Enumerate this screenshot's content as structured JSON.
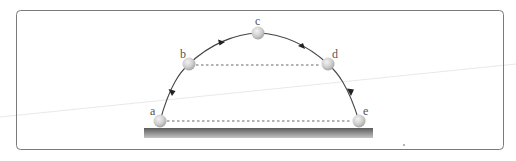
{
  "diagram": {
    "points": [
      {
        "label": "a",
        "x": 160,
        "y": 121
      },
      {
        "label": "b",
        "x": 189,
        "y": 64
      },
      {
        "label": "c",
        "x": 258,
        "y": 33
      },
      {
        "label": "d",
        "x": 328,
        "y": 64
      },
      {
        "label": "e",
        "x": 359,
        "y": 121
      }
    ],
    "dashed_lines": [
      {
        "from": "b",
        "to": "d"
      },
      {
        "from": "a",
        "to": "e"
      }
    ],
    "colors": {
      "border": "#777777",
      "path": "#444444",
      "ball": "#c8c8c8",
      "ground_top": "#555555",
      "ground_bottom": "#bdbdbd"
    }
  }
}
